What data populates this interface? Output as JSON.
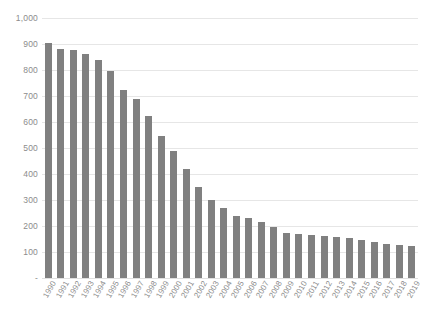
{
  "chart_data": {
    "type": "bar",
    "title": "",
    "subtitle": "",
    "xlabel": "",
    "ylabel": "",
    "ylim": [
      0,
      1000
    ],
    "ytick_interval": 100,
    "yticks": [
      0,
      100,
      200,
      300,
      400,
      500,
      600,
      700,
      800,
      900,
      1000
    ],
    "ytick_labels": [
      "-",
      "100",
      "200",
      "300",
      "400",
      "500",
      "600",
      "700",
      "800",
      "900",
      "1,000"
    ],
    "grid": true,
    "legend": false,
    "legend_position": "none",
    "bar_color": "#808080",
    "gridline_color": "#e6e6e6",
    "axis_label_color": "#8c8c8c",
    "categories": [
      "1990",
      "1991",
      "1992",
      "1993",
      "1994",
      "1995",
      "1996",
      "1997",
      "1998",
      "1999",
      "2000",
      "2001",
      "2002",
      "2003",
      "2004",
      "2005",
      "2006",
      "2007",
      "2008",
      "2009",
      "2010",
      "2011",
      "2012",
      "2013",
      "2014",
      "2015",
      "2016",
      "2017",
      "2018",
      "2019"
    ],
    "values": [
      905,
      880,
      878,
      862,
      838,
      795,
      725,
      690,
      625,
      545,
      490,
      420,
      350,
      300,
      268,
      240,
      232,
      215,
      198,
      172,
      168,
      165,
      162,
      158,
      152,
      148,
      140,
      132,
      128,
      125
    ]
  }
}
